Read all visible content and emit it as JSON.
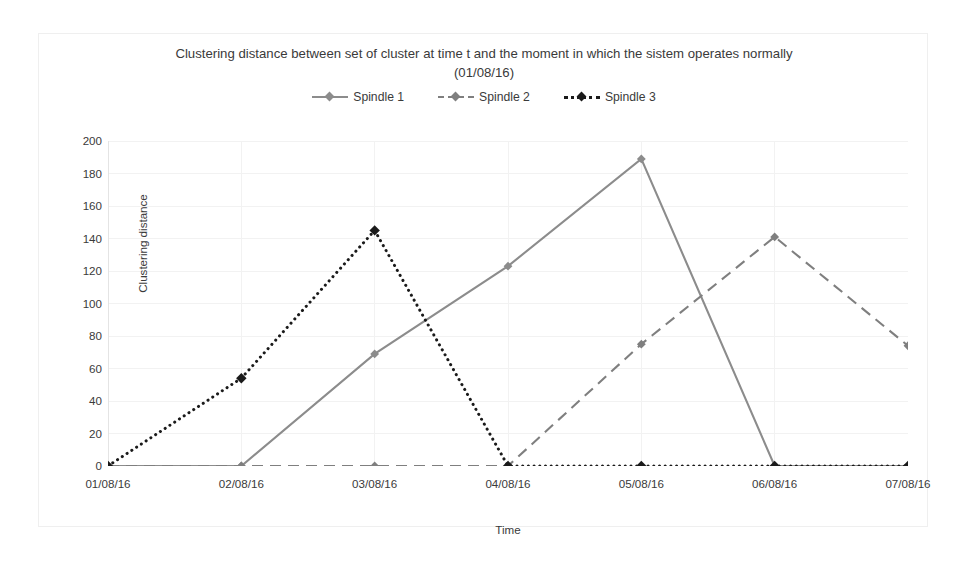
{
  "chart_data": {
    "type": "line",
    "title": "Clustering distance between set of cluster at time t and the moment in which the sistem operates normally",
    "subtitle": "(01/08/16)",
    "xlabel": "Time",
    "ylabel": "Clustering distance",
    "categories": [
      "01/08/16",
      "02/08/16",
      "03/08/16",
      "04/08/16",
      "05/08/16",
      "06/08/16",
      "07/08/16"
    ],
    "ylim": [
      0,
      200
    ],
    "yticks": [
      0,
      20,
      40,
      60,
      80,
      100,
      120,
      140,
      160,
      180,
      200
    ],
    "grid": true,
    "legend_position": "top",
    "series": [
      {
        "name": "Spindle 1",
        "values": [
          0,
          0,
          69,
          123,
          189,
          0,
          0
        ],
        "color": "#8c8c8c",
        "style": "solid"
      },
      {
        "name": "Spindle 2",
        "values": [
          0,
          0,
          0,
          0,
          75,
          141,
          74
        ],
        "color": "#7f7f7f",
        "style": "dashed"
      },
      {
        "name": "Spindle 3",
        "values": [
          0,
          54,
          145,
          0,
          0,
          0,
          0
        ],
        "color": "#1a1a1a",
        "style": "dotted"
      }
    ]
  },
  "colors": {
    "frame_border": "#efefef",
    "gridline": "#f2f2f2",
    "axis_line": "#e4e4e4",
    "text": "#3a3a3a",
    "background": "#ffffff"
  }
}
